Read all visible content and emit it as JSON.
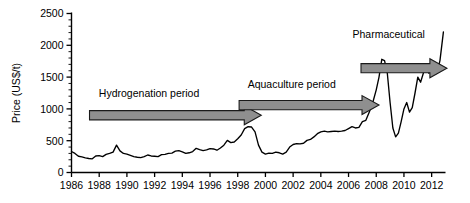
{
  "chart_data": {
    "type": "line",
    "title": "",
    "xlabel": "",
    "ylabel": "Price (US$/t)",
    "xlim": [
      1986,
      2013
    ],
    "ylim": [
      0,
      2500
    ],
    "ytick_labels": [
      "0",
      "500",
      "1000",
      "1500",
      "2000",
      "2500"
    ],
    "ytick_values": [
      0,
      500,
      1000,
      1500,
      2000,
      2500
    ],
    "yminor_step": 100,
    "xtick_labels": [
      "1986",
      "1988",
      "1990",
      "1992",
      "1994",
      "1996",
      "1998",
      "2000",
      "2002",
      "2004",
      "2006",
      "2008",
      "2010",
      "2012"
    ],
    "xtick_values": [
      1986,
      1988,
      1990,
      1992,
      1994,
      1996,
      1998,
      2000,
      2002,
      2004,
      2006,
      2008,
      2010,
      2012
    ],
    "grid": false,
    "legend": null,
    "series": [
      {
        "name": "Fish oil price",
        "color": "#000000",
        "x": [
          1986.0,
          1986.25,
          1986.5,
          1986.75,
          1987.0,
          1987.25,
          1987.5,
          1987.75,
          1988.0,
          1988.25,
          1988.5,
          1988.75,
          1989.0,
          1989.25,
          1989.5,
          1989.75,
          1990.0,
          1990.25,
          1990.5,
          1990.75,
          1991.0,
          1991.25,
          1991.5,
          1991.75,
          1992.0,
          1992.25,
          1992.5,
          1992.75,
          1993.0,
          1993.25,
          1993.5,
          1993.75,
          1994.0,
          1994.25,
          1994.5,
          1994.75,
          1995.0,
          1995.25,
          1995.5,
          1995.75,
          1996.0,
          1996.25,
          1996.5,
          1996.75,
          1997.0,
          1997.25,
          1997.5,
          1997.75,
          1998.0,
          1998.25,
          1998.5,
          1998.75,
          1999.0,
          1999.25,
          1999.5,
          1999.75,
          2000.0,
          2000.25,
          2000.5,
          2000.75,
          2001.0,
          2001.25,
          2001.5,
          2001.75,
          2002.0,
          2002.25,
          2002.5,
          2002.75,
          2003.0,
          2003.25,
          2003.5,
          2003.75,
          2004.0,
          2004.25,
          2004.5,
          2004.75,
          2005.0,
          2005.25,
          2005.5,
          2005.75,
          2006.0,
          2006.25,
          2006.5,
          2006.75,
          2007.0,
          2007.25,
          2007.5,
          2007.75,
          2008.0,
          2008.2,
          2008.4,
          2008.6,
          2008.8,
          2009.0,
          2009.2,
          2009.4,
          2009.6,
          2009.8,
          2010.0,
          2010.2,
          2010.4,
          2010.6,
          2010.8,
          2011.0,
          2011.2,
          2011.4,
          2011.6,
          2011.8,
          2012.0,
          2012.2,
          2012.4,
          2012.6,
          2012.85
        ],
        "y": [
          330,
          300,
          255,
          245,
          230,
          220,
          215,
          260,
          265,
          250,
          285,
          300,
          320,
          430,
          340,
          300,
          290,
          270,
          250,
          240,
          235,
          250,
          275,
          260,
          255,
          250,
          280,
          285,
          300,
          305,
          335,
          345,
          325,
          300,
          310,
          330,
          380,
          360,
          345,
          355,
          375,
          370,
          350,
          385,
          430,
          505,
          470,
          480,
          530,
          590,
          690,
          720,
          715,
          640,
          430,
          320,
          290,
          305,
          300,
          320,
          310,
          290,
          320,
          400,
          440,
          455,
          450,
          460,
          505,
          520,
          560,
          610,
          640,
          650,
          640,
          645,
          650,
          645,
          650,
          660,
          690,
          720,
          700,
          710,
          800,
          820,
          950,
          1100,
          1300,
          1500,
          1780,
          1760,
          1560,
          1100,
          700,
          560,
          620,
          800,
          1000,
          1100,
          950,
          1020,
          1250,
          1500,
          1420,
          1560,
          1700,
          1560,
          1640,
          1620,
          1580,
          1760,
          2210
        ]
      }
    ],
    "annotations": [
      {
        "id": "hydrogenation",
        "label": "Hydrogenation period",
        "label_x_data": 1991.6,
        "label_y_data": 1180,
        "arrow_x_start": 1987.3,
        "arrow_x_end": 1999.7,
        "arrow_y_data": 900,
        "arrow_color": "#8f8f8f",
        "arrow_outline": "#1a1a1a"
      },
      {
        "id": "aquaculture",
        "label": "Aquaculture period",
        "label_x_data": 2001.9,
        "label_y_data": 1330,
        "arrow_x_start": 1998.1,
        "arrow_x_end": 2008.2,
        "arrow_y_data": 1060,
        "arrow_color": "#8f8f8f",
        "arrow_outline": "#1a1a1a"
      },
      {
        "id": "pharmaceutical",
        "label": "Pharmaceutical",
        "label_x_data": 2008.9,
        "label_y_data": 2110,
        "arrow_x_start": 2006.9,
        "arrow_x_end": 2013.1,
        "arrow_y_data": 1640,
        "arrow_color": "#8f8f8f",
        "arrow_outline": "#1a1a1a"
      }
    ]
  }
}
